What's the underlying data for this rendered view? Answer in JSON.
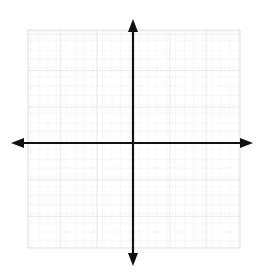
{
  "chart_data": {
    "type": "scatter",
    "title": "",
    "subtitle": "",
    "xlabel": "",
    "ylabel": "",
    "series": [
      {
        "name": "empty",
        "x": [],
        "y": [],
        "values": []
      }
    ],
    "categories": [],
    "x": [],
    "values": [],
    "annotations": [],
    "legend": {
      "entries": [],
      "position": "none",
      "visible": false
    },
    "grid": {
      "visible": true,
      "minor_visible": true,
      "major_every": 4,
      "minor_cell_px": 9.1,
      "minor_color": "#e8e8e8",
      "major_color": "#cfcfcf",
      "left_px": 28,
      "top_px": 30,
      "right_px": 240,
      "bottom_px": 248
    },
    "axes": {
      "color": "#111111",
      "line_width_px": 2,
      "origin_px": [
        133,
        143
      ],
      "x_axis": {
        "visible": true,
        "ticks": [],
        "tick_labels": [],
        "arrow_start": true,
        "arrow_end": true,
        "start_px": 14,
        "end_px": 250
      },
      "y_axis": {
        "visible": true,
        "ticks": [],
        "tick_labels": [],
        "arrow_start": true,
        "arrow_end": true,
        "start_px": 22,
        "end_px": 262
      },
      "xlim": [
        -13,
        12
      ],
      "ylim": [
        -12,
        13
      ]
    },
    "description": "Blank Cartesian coordinate plane with faint square grid and four-way arrowed axes; no plotted data, no tick labels."
  },
  "figure": {
    "width_px": 263,
    "height_px": 276,
    "background": "#ffffff",
    "caption": ""
  },
  "icons": {
    "arrow_up": "y-axis-arrow-up",
    "arrow_down": "y-axis-arrow-down",
    "arrow_left": "x-axis-arrow-left",
    "arrow_right": "x-axis-arrow-right"
  }
}
